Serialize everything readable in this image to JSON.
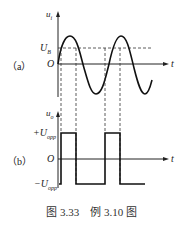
{
  "figure": {
    "caption": "图 3.33　例 3.10 图",
    "panel_a": {
      "label": "（a）",
      "y_axis_label": "u",
      "y_axis_sub": "i",
      "x_axis_label": "t",
      "origin_label": "O",
      "threshold_label": "U",
      "threshold_sub": "B"
    },
    "panel_b": {
      "label": "（b）",
      "y_axis_label": "u",
      "y_axis_sub": "o",
      "x_axis_label": "t",
      "origin_label": "O",
      "high_label": "+U",
      "high_sub": "opp",
      "low_label": "−U",
      "low_sub": "opp"
    }
  }
}
